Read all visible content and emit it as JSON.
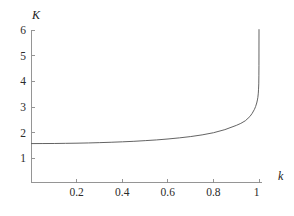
{
  "figure": {
    "background_color": "#ffffff",
    "curve_color": "#5b5b5b",
    "axis_color": "#8a8a8a",
    "label_color": "#2b2b2b"
  },
  "chart_data": {
    "type": "line",
    "title": "",
    "xlabel": "k",
    "ylabel": "K",
    "xlim": [
      0,
      1.0
    ],
    "ylim": [
      0,
      6
    ],
    "grid": false,
    "legend": null,
    "x_ticks": [
      0.2,
      0.4,
      0.6,
      0.8,
      1
    ],
    "x_tick_labels": [
      "0.2",
      "0.4",
      "0.6",
      "0.8",
      "1"
    ],
    "y_ticks": [
      1,
      2,
      3,
      4,
      5,
      6
    ],
    "y_tick_labels": [
      "1",
      "2",
      "3",
      "4",
      "5",
      "6"
    ],
    "series": [
      {
        "name": "K(k)",
        "description": "Complete elliptic integral of the first kind",
        "x": [
          0,
          0.05,
          0.1,
          0.15,
          0.2,
          0.25,
          0.3,
          0.35,
          0.4,
          0.45,
          0.5,
          0.55,
          0.6,
          0.65,
          0.7,
          0.75,
          0.8,
          0.85,
          0.9,
          0.92,
          0.94,
          0.96,
          0.97,
          0.98,
          0.985,
          0.99,
          0.993,
          0.995,
          0.997,
          0.998,
          0.999,
          0.9995,
          0.9998
        ],
        "values": [
          1.5708,
          1.5728,
          1.5747,
          1.5805,
          1.5869,
          1.5962,
          1.608,
          1.6229,
          1.64,
          1.6602,
          1.6858,
          1.7139,
          1.7508,
          1.7943,
          1.8457,
          1.9109,
          1.9953,
          2.1155,
          2.2805,
          2.3593,
          2.4631,
          2.6278,
          2.7508,
          2.9083,
          3.0161,
          3.1559,
          3.2753,
          3.378,
          3.5402,
          3.6956,
          3.9033,
          4.2417,
          4.6144
        ]
      }
    ],
    "asymptote": {
      "at_x": 1.0,
      "note": "K(k) diverges logarithmically as k approaches 1"
    }
  }
}
